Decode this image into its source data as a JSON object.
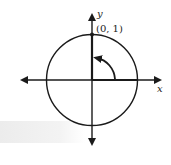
{
  "diagram": {
    "type": "unit-circle",
    "axes": {
      "x_label": "x",
      "y_label": "y"
    },
    "point": {
      "label": "(0, 1)",
      "x": 0,
      "y": 1
    },
    "rotation_arrow": {
      "direction": "counterclockwise",
      "from_angle_deg": 0,
      "to_angle_deg": 90
    },
    "colors": {
      "stroke": "#1a1a1a",
      "band": "#ececec"
    }
  }
}
